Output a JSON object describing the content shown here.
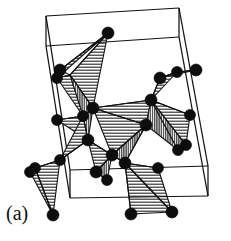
{
  "figure": {
    "panel_label": "(a)",
    "caption_text": "",
    "background_color": "#ffffff",
    "line_color": "#121212",
    "atom_color": "#0d0d0d",
    "hatch_light_color": "#2b2b2b",
    "hatch_dark_color": "#3a3a3a"
  },
  "chart_data": {
    "type": "diagram",
    "title": "",
    "subtitle": "",
    "xlabel": "",
    "ylabel": "",
    "legend": [],
    "annotations": [
      "(a)"
    ],
    "unit_cell": {
      "name": "unit-cell-box",
      "style": "wireframe parallelepiped",
      "front_face": [
        [
          46,
          46
        ],
        [
          179,
          37
        ],
        [
          208,
          196
        ],
        [
          70,
          198
        ]
      ],
      "back_face": [
        [
          46,
          16
        ],
        [
          179,
          8
        ],
        [
          208,
          166
        ],
        [
          70,
          170
        ]
      ],
      "vertices_front": [
        [
          46,
          46
        ],
        [
          179,
          37
        ],
        [
          208,
          196
        ],
        [
          70,
          198
        ]
      ],
      "vertices_back": [
        [
          46,
          16
        ],
        [
          179,
          8
        ],
        [
          208,
          166
        ],
        [
          70,
          170
        ]
      ],
      "edges": [
        [
          [
            46,
            46
          ],
          [
            179,
            37
          ]
        ],
        [
          [
            179,
            37
          ],
          [
            208,
            196
          ]
        ],
        [
          [
            208,
            196
          ],
          [
            70,
            198
          ]
        ],
        [
          [
            70,
            198
          ],
          [
            46,
            46
          ]
        ],
        [
          [
            46,
            16
          ],
          [
            179,
            8
          ]
        ],
        [
          [
            179,
            8
          ],
          [
            208,
            166
          ]
        ],
        [
          [
            208,
            166
          ],
          [
            70,
            170
          ]
        ],
        [
          [
            70,
            170
          ],
          [
            46,
            16
          ]
        ],
        [
          [
            46,
            46
          ],
          [
            46,
            16
          ]
        ],
        [
          [
            179,
            37
          ],
          [
            179,
            8
          ]
        ],
        [
          [
            208,
            196
          ],
          [
            208,
            166
          ]
        ],
        [
          [
            70,
            198
          ],
          [
            70,
            170
          ]
        ]
      ]
    },
    "hatch_patterns": {
      "light": {
        "orientation": "horizontal",
        "spacing_px": 3,
        "stroke_width_px": 1
      },
      "dark": {
        "orientation": "vertical",
        "spacing_px": 2,
        "stroke_width_px": 1
      }
    },
    "faces": [
      {
        "id": "f1",
        "fill": "light",
        "points": [
          [
            108,
            33
          ],
          [
            70,
            75
          ],
          [
            93,
            108
          ]
        ]
      },
      {
        "id": "f2",
        "fill": "light",
        "points": [
          [
            108,
            33
          ],
          [
            60,
            70
          ],
          [
            57,
            78
          ]
        ]
      },
      {
        "id": "f3",
        "fill": "dark",
        "points": [
          [
            70,
            75
          ],
          [
            93,
            108
          ],
          [
            82,
            118
          ]
        ]
      },
      {
        "id": "f4",
        "fill": "light",
        "points": [
          [
            57,
            78
          ],
          [
            70,
            75
          ],
          [
            83,
            116
          ]
        ]
      },
      {
        "id": "f5",
        "fill": "dark",
        "points": [
          [
            83,
            116
          ],
          [
            93,
            108
          ],
          [
            88,
            140
          ]
        ]
      },
      {
        "id": "f6",
        "fill": "light",
        "points": [
          [
            57,
            120
          ],
          [
            83,
            116
          ],
          [
            88,
            140
          ]
        ]
      },
      {
        "id": "f7",
        "fill": "light",
        "points": [
          [
            83,
            116
          ],
          [
            88,
            140
          ],
          [
            60,
            160
          ]
        ]
      },
      {
        "id": "f8",
        "fill": "light",
        "points": [
          [
            93,
            108
          ],
          [
            146,
            125
          ],
          [
            151,
            100
          ]
        ]
      },
      {
        "id": "f9",
        "fill": "light",
        "points": [
          [
            93,
            108
          ],
          [
            146,
            125
          ],
          [
            112,
            155
          ]
        ]
      },
      {
        "id": "f10",
        "fill": "dark",
        "points": [
          [
            146,
            125
          ],
          [
            112,
            155
          ],
          [
            125,
            163
          ]
        ]
      },
      {
        "id": "f11",
        "fill": "light",
        "points": [
          [
            88,
            140
          ],
          [
            112,
            155
          ],
          [
            96,
            172
          ]
        ]
      },
      {
        "id": "f12",
        "fill": "dark",
        "points": [
          [
            96,
            172
          ],
          [
            112,
            155
          ],
          [
            107,
            180
          ]
        ]
      },
      {
        "id": "f13",
        "fill": "light",
        "points": [
          [
            151,
            100
          ],
          [
            160,
            78
          ],
          [
            177,
            72
          ]
        ]
      },
      {
        "id": "f14",
        "fill": "light",
        "points": [
          [
            160,
            78
          ],
          [
            177,
            72
          ],
          [
            196,
            70
          ]
        ]
      },
      {
        "id": "f15",
        "fill": "dark",
        "points": [
          [
            151,
            100
          ],
          [
            146,
            125
          ],
          [
            178,
            150
          ]
        ]
      },
      {
        "id": "f16",
        "fill": "dark",
        "points": [
          [
            151,
            100
          ],
          [
            178,
            150
          ],
          [
            186,
            145
          ]
        ]
      },
      {
        "id": "f17",
        "fill": "light",
        "points": [
          [
            151,
            100
          ],
          [
            186,
            145
          ],
          [
            190,
            115
          ]
        ]
      },
      {
        "id": "f18",
        "fill": "light",
        "points": [
          [
            35,
            168
          ],
          [
            60,
            160
          ],
          [
            53,
            215
          ]
        ]
      },
      {
        "id": "f19",
        "fill": "light",
        "points": [
          [
            35,
            168
          ],
          [
            53,
            215
          ],
          [
            30,
            172
          ]
        ]
      },
      {
        "id": "f20",
        "fill": "light",
        "points": [
          [
            125,
            163
          ],
          [
            131,
            214
          ],
          [
            172,
            212
          ]
        ]
      },
      {
        "id": "f21",
        "fill": "light",
        "points": [
          [
            125,
            163
          ],
          [
            172,
            212
          ],
          [
            158,
            168
          ]
        ]
      }
    ],
    "bonds": [
      [
        [
          108,
          33
        ],
        [
          70,
          75
        ]
      ],
      [
        [
          108,
          33
        ],
        [
          60,
          70
        ]
      ],
      [
        [
          70,
          75
        ],
        [
          60,
          70
        ]
      ],
      [
        [
          70,
          75
        ],
        [
          57,
          78
        ]
      ],
      [
        [
          70,
          75
        ],
        [
          93,
          108
        ]
      ],
      [
        [
          93,
          108
        ],
        [
          83,
          116
        ]
      ],
      [
        [
          83,
          116
        ],
        [
          57,
          120
        ]
      ],
      [
        [
          83,
          116
        ],
        [
          88,
          140
        ]
      ],
      [
        [
          88,
          140
        ],
        [
          60,
          160
        ]
      ],
      [
        [
          60,
          160
        ],
        [
          35,
          168
        ]
      ],
      [
        [
          35,
          168
        ],
        [
          30,
          172
        ]
      ],
      [
        [
          35,
          168
        ],
        [
          53,
          215
        ]
      ],
      [
        [
          93,
          108
        ],
        [
          151,
          100
        ]
      ],
      [
        [
          93,
          108
        ],
        [
          146,
          125
        ]
      ],
      [
        [
          146,
          125
        ],
        [
          112,
          155
        ]
      ],
      [
        [
          112,
          155
        ],
        [
          125,
          163
        ]
      ],
      [
        [
          112,
          155
        ],
        [
          96,
          172
        ]
      ],
      [
        [
          96,
          172
        ],
        [
          107,
          180
        ]
      ],
      [
        [
          88,
          140
        ],
        [
          112,
          155
        ]
      ],
      [
        [
          151,
          100
        ],
        [
          160,
          78
        ]
      ],
      [
        [
          160,
          78
        ],
        [
          177,
          72
        ]
      ],
      [
        [
          177,
          72
        ],
        [
          196,
          70
        ]
      ],
      [
        [
          151,
          100
        ],
        [
          190,
          115
        ]
      ],
      [
        [
          151,
          100
        ],
        [
          186,
          145
        ]
      ],
      [
        [
          186,
          145
        ],
        [
          178,
          150
        ]
      ],
      [
        [
          146,
          125
        ],
        [
          125,
          163
        ]
      ],
      [
        [
          125,
          163
        ],
        [
          131,
          214
        ]
      ],
      [
        [
          125,
          163
        ],
        [
          172,
          212
        ]
      ],
      [
        [
          125,
          163
        ],
        [
          158,
          168
        ]
      ]
    ],
    "atoms": [
      {
        "id": "a1",
        "x": 108,
        "y": 33,
        "r": 6.0
      },
      {
        "id": "a2",
        "x": 60,
        "y": 70,
        "r": 6.0
      },
      {
        "id": "a3",
        "x": 57,
        "y": 78,
        "r": 5.5
      },
      {
        "id": "a4",
        "x": 93,
        "y": 108,
        "r": 6.0
      },
      {
        "id": "a5",
        "x": 83,
        "y": 116,
        "r": 5.5
      },
      {
        "id": "a6",
        "x": 57,
        "y": 120,
        "r": 5.5
      },
      {
        "id": "a7",
        "x": 88,
        "y": 140,
        "r": 6.0
      },
      {
        "id": "a8",
        "x": 60,
        "y": 160,
        "r": 5.5
      },
      {
        "id": "a9",
        "x": 35,
        "y": 168,
        "r": 5.5
      },
      {
        "id": "a10",
        "x": 30,
        "y": 172,
        "r": 5.5
      },
      {
        "id": "a11",
        "x": 53,
        "y": 215,
        "r": 6.0
      },
      {
        "id": "a12",
        "x": 151,
        "y": 100,
        "r": 6.0
      },
      {
        "id": "a13",
        "x": 146,
        "y": 125,
        "r": 6.0
      },
      {
        "id": "a14",
        "x": 160,
        "y": 78,
        "r": 6.0
      },
      {
        "id": "a15",
        "x": 177,
        "y": 72,
        "r": 5.5
      },
      {
        "id": "a16",
        "x": 196,
        "y": 70,
        "r": 6.0
      },
      {
        "id": "a17",
        "x": 190,
        "y": 115,
        "r": 5.5
      },
      {
        "id": "a18",
        "x": 186,
        "y": 145,
        "r": 5.5
      },
      {
        "id": "a19",
        "x": 178,
        "y": 150,
        "r": 5.5
      },
      {
        "id": "a20",
        "x": 112,
        "y": 155,
        "r": 6.0
      },
      {
        "id": "a21",
        "x": 96,
        "y": 172,
        "r": 6.0
      },
      {
        "id": "a22",
        "x": 107,
        "y": 180,
        "r": 5.5
      },
      {
        "id": "a23",
        "x": 125,
        "y": 163,
        "r": 6.0
      },
      {
        "id": "a24",
        "x": 131,
        "y": 214,
        "r": 6.0
      },
      {
        "id": "a25",
        "x": 172,
        "y": 212,
        "r": 6.0
      },
      {
        "id": "a26",
        "x": 158,
        "y": 168,
        "r": 5.5
      }
    ]
  }
}
